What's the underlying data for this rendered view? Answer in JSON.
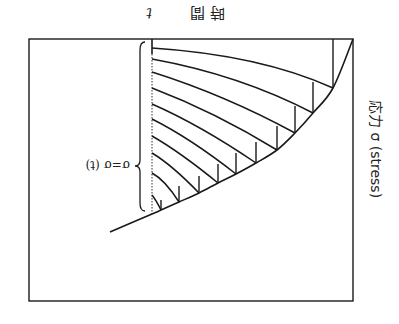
{
  "figure": {
    "orientation": "rotated 180 degrees (printed upside down)",
    "frame": {
      "x1": 29,
      "y1": 39,
      "x2": 353,
      "y2": 301
    },
    "time_axis_x": 152,
    "time_axis_solid_to_y": 54,
    "labels": {
      "time_axis": "時 間 t",
      "time_axis_kanji": "時 間",
      "time_axis_symbol": "t",
      "stress_axis": "応力 σ (stress)",
      "function": "σ=σ (t)"
    },
    "main_curve": [
      [
        110,
        232
      ],
      [
        152,
        214
      ],
      [
        161,
        210
      ],
      [
        179,
        202
      ],
      [
        199,
        193
      ],
      [
        218,
        183
      ],
      [
        236,
        174
      ],
      [
        256,
        163
      ],
      [
        277,
        150
      ],
      [
        295,
        133
      ],
      [
        313,
        113
      ],
      [
        333,
        88
      ],
      [
        353,
        39
      ]
    ],
    "hatch_curves": [
      {
        "start": [
          152,
          48
        ],
        "ctrl": [
          260,
          55
        ],
        "end": [
          333,
          88
        ]
      },
      {
        "start": [
          152,
          59
        ],
        "ctrl": [
          240,
          75
        ],
        "end": [
          313,
          113
        ]
      },
      {
        "start": [
          152,
          72
        ],
        "ctrl": [
          225,
          95
        ],
        "end": [
          295,
          133
        ]
      },
      {
        "start": [
          152,
          88
        ],
        "ctrl": [
          215,
          112
        ],
        "end": [
          277,
          150
        ]
      },
      {
        "start": [
          152,
          104
        ],
        "ctrl": [
          200,
          125
        ],
        "end": [
          256,
          163
        ]
      },
      {
        "start": [
          152,
          119
        ],
        "ctrl": [
          190,
          138
        ],
        "end": [
          236,
          174
        ]
      },
      {
        "start": [
          152,
          136
        ],
        "ctrl": [
          180,
          152
        ],
        "end": [
          218,
          183
        ]
      },
      {
        "start": [
          152,
          153
        ],
        "ctrl": [
          172,
          165
        ],
        "end": [
          199,
          193
        ]
      },
      {
        "start": [
          152,
          173
        ],
        "ctrl": [
          165,
          180
        ],
        "end": [
          179,
          202
        ]
      },
      {
        "start": [
          152,
          195
        ],
        "ctrl": [
          156,
          200
        ],
        "end": [
          161,
          210
        ]
      }
    ],
    "verticals": [
      {
        "x": 333,
        "y1": 39,
        "y2": 88
      },
      {
        "x": 313,
        "y1": 82,
        "y2": 113
      },
      {
        "x": 295,
        "y1": 106,
        "y2": 133
      },
      {
        "x": 277,
        "y1": 126,
        "y2": 150
      },
      {
        "x": 256,
        "y1": 142,
        "y2": 163
      },
      {
        "x": 236,
        "y1": 153,
        "y2": 174
      },
      {
        "x": 218,
        "y1": 164,
        "y2": 183
      },
      {
        "x": 199,
        "y1": 176,
        "y2": 193
      },
      {
        "x": 179,
        "y1": 186,
        "y2": 202
      },
      {
        "x": 161,
        "y1": 200,
        "y2": 210
      }
    ],
    "brace": {
      "x": 140,
      "y_top": 42,
      "y_bottom": 211,
      "y_tip": 166
    },
    "colors": {
      "ink": "#1a1a1a",
      "background": "#ffffff"
    }
  }
}
